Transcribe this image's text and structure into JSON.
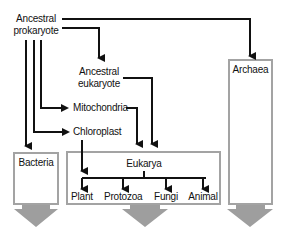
{
  "nodes": {
    "ancestral_prokaryote": {
      "line1": "Ancestral",
      "line2": "prokaryote"
    },
    "ancestral_eukaryote": {
      "line1": "Ancestral",
      "line2": "eukaryote"
    },
    "mitochondria": "Mitochondria",
    "chloroplast": "Chloroplast"
  },
  "domains": {
    "bacteria": "Bacteria",
    "eukarya": "Eukarya",
    "archaea": "Archaea"
  },
  "kingdoms": [
    "Plant",
    "Protozoa",
    "Fungi",
    "Animal"
  ],
  "colors": {
    "line": "#111111",
    "box_border": "#a3a3a3",
    "down_arrow": "#9e9e9e"
  }
}
